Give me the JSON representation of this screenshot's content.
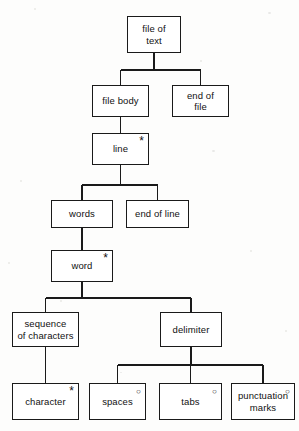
{
  "diagram": {
    "notation": {
      "iteration_marker": "*",
      "selection_marker": "○"
    },
    "line_color": "#1a1a1a",
    "box_fill": "#ffffff",
    "background": "#fdfdfc",
    "nodes": [
      {
        "id": "file-of-text",
        "label": "file of\ntext",
        "marker": "",
        "x": 127,
        "y": 16,
        "w": 54,
        "h": 37
      },
      {
        "id": "file-body",
        "label": "file body",
        "marker": "",
        "x": 92,
        "y": 85,
        "w": 57,
        "h": 32
      },
      {
        "id": "end-of-file",
        "label": "end of\nfile",
        "marker": "",
        "x": 172,
        "y": 85,
        "w": 57,
        "h": 32
      },
      {
        "id": "line",
        "label": "line",
        "marker": "*",
        "x": 92,
        "y": 133,
        "w": 57,
        "h": 32
      },
      {
        "id": "words",
        "label": "words",
        "marker": "",
        "x": 51,
        "y": 200,
        "w": 62,
        "h": 28
      },
      {
        "id": "end-of-line",
        "label": "end of line",
        "marker": "",
        "x": 126,
        "y": 200,
        "w": 63,
        "h": 28
      },
      {
        "id": "word",
        "label": "word",
        "marker": "*",
        "x": 51,
        "y": 250,
        "w": 62,
        "h": 32
      },
      {
        "id": "sequence-of-characters",
        "label": "sequence\nof characters",
        "marker": "",
        "x": 12,
        "y": 312,
        "w": 67,
        "h": 35
      },
      {
        "id": "delimiter",
        "label": "delimiter",
        "marker": "",
        "x": 160,
        "y": 312,
        "w": 62,
        "h": 35
      },
      {
        "id": "character",
        "label": "character",
        "marker": "*",
        "x": 12,
        "y": 383,
        "w": 67,
        "h": 37
      },
      {
        "id": "spaces",
        "label": "spaces",
        "marker": "○",
        "x": 89,
        "y": 383,
        "w": 57,
        "h": 37
      },
      {
        "id": "tabs",
        "label": "tabs",
        "marker": "○",
        "x": 159,
        "y": 383,
        "w": 63,
        "h": 37
      },
      {
        "id": "punctuation-marks",
        "label": "punctuation\nmarks",
        "marker": "○",
        "x": 231,
        "y": 383,
        "w": 64,
        "h": 37
      }
    ],
    "edges": [
      {
        "from": "file-of-text",
        "to": [
          "file-body",
          "end-of-file"
        ],
        "bus_y": 70
      },
      {
        "from": "file-body",
        "to": [
          "line"
        ],
        "bus_y": 0
      },
      {
        "from": "line",
        "to": [
          "words",
          "end-of-line"
        ],
        "bus_y": 185
      },
      {
        "from": "words",
        "to": [
          "word"
        ],
        "bus_y": 0
      },
      {
        "from": "word",
        "to": [
          "sequence-of-characters",
          "delimiter"
        ],
        "bus_y": 298
      },
      {
        "from": "sequence-of-characters",
        "to": [
          "character"
        ],
        "bus_y": 0
      },
      {
        "from": "delimiter",
        "to": [
          "spaces",
          "tabs",
          "punctuation-marks"
        ],
        "bus_y": 365
      }
    ]
  }
}
